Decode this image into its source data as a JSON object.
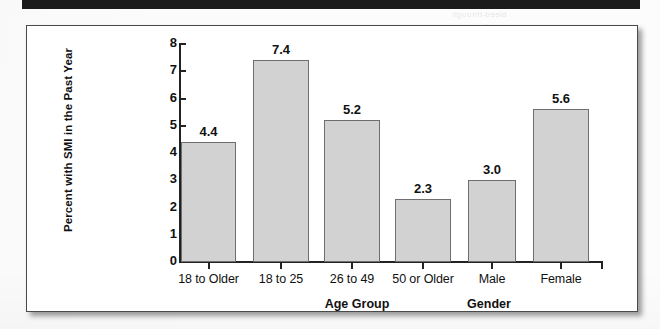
{
  "page": {
    "background_color": "#fcfcfc",
    "header_rule_color": "#1b1b1b"
  },
  "figure": {
    "frame_border_color": "#4a4a4a",
    "bar_fill_color": "#d2d2d2",
    "bar_edge_color": "#6e6e6e",
    "axis_color": "#222222"
  },
  "chart_data": {
    "type": "bar",
    "title": "",
    "xlabel": "",
    "ylabel": "Percent with SMI in the Past Year",
    "ylim": [
      0,
      8
    ],
    "yticks": [
      "0",
      "1",
      "2",
      "3",
      "4",
      "5",
      "6",
      "7",
      "8"
    ],
    "grid": false,
    "legend": "none",
    "categories": [
      "18 to Older",
      "18 to 25",
      "26 to 49",
      "50 or Older",
      "Male",
      "Female"
    ],
    "values": [
      4.4,
      7.4,
      5.2,
      2.3,
      3.0,
      5.6
    ],
    "value_labels": [
      "4.4",
      "7.4",
      "5.2",
      "2.3",
      "3.0",
      "5.6"
    ],
    "group_labels": [
      "Age Group",
      "Gender"
    ],
    "groups": [
      {
        "label": "Age Group",
        "categories": [
          "18 to Older",
          "18 to 25",
          "26 to 49",
          "50 or Older"
        ]
      },
      {
        "label": "Gender",
        "categories": [
          "Male",
          "Female"
        ]
      }
    ]
  },
  "bleed_text": {
    "line1": "bleed-through",
    "line2": "faint"
  }
}
